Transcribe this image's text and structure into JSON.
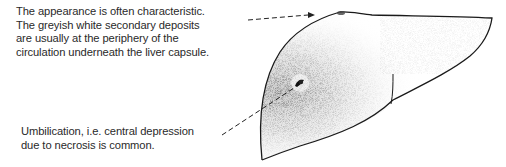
{
  "figure": {
    "annotations": [
      {
        "id": "appearance",
        "lines": [
          "The appearance is often characteristic.",
          "The greyish white secondary deposits",
          "are usually at the periphery of the",
          "circulation underneath the liver capsule."
        ],
        "points_to": "subcapsular deposit"
      },
      {
        "id": "umbilication",
        "lines": [
          "Umbilication, i.e. central depression",
          "due to necrosis is common."
        ],
        "points_to": "umbilicated deposit"
      }
    ],
    "colors": {
      "text": "#2a2a2a",
      "outline": "#1a1a1a",
      "stipple": "#333333"
    }
  }
}
